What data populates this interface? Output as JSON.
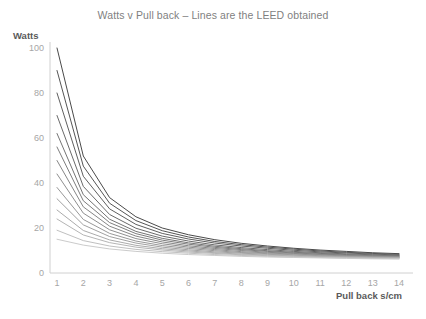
{
  "chart_data": {
    "type": "line",
    "title": "Watts v Pull back – Lines are the LEED obtained",
    "xlabel": "Pull back s/cm",
    "ylabel": "Watts",
    "grid": false,
    "legend": "none",
    "xlim": [
      1,
      14
    ],
    "ylim": [
      0,
      100
    ],
    "x": [
      1,
      2,
      3,
      4,
      5,
      6,
      7,
      8,
      9,
      10,
      11,
      12,
      13,
      14
    ],
    "xticks": [
      "1",
      "2",
      "3",
      "4",
      "5",
      "6",
      "7",
      "8",
      "9",
      "10",
      "11",
      "12",
      "13",
      "14"
    ],
    "yticks": [
      "0",
      "20",
      "40",
      "60",
      "80",
      "100"
    ],
    "ytick_values": [
      0,
      20,
      40,
      60,
      80,
      100
    ],
    "series": [
      {
        "name": "LEED 100",
        "color": "#4a4a4a",
        "values": [
          100,
          52.0,
          33.5,
          25.0,
          20.0,
          17.0,
          14.8,
          13.2,
          12.0,
          11.0,
          10.2,
          9.6,
          9.0,
          8.6
        ]
      },
      {
        "name": "LEED 90",
        "color": "#555555",
        "values": [
          90,
          47.5,
          31.0,
          23.3,
          18.8,
          16.0,
          14.0,
          12.6,
          11.5,
          10.6,
          9.8,
          9.2,
          8.7,
          8.3
        ]
      },
      {
        "name": "LEED 80",
        "color": "#5f5f5f",
        "values": [
          80,
          43.0,
          28.5,
          21.6,
          17.6,
          15.1,
          13.3,
          12.0,
          11.0,
          10.1,
          9.4,
          8.9,
          8.4,
          8.0
        ]
      },
      {
        "name": "LEED 70",
        "color": "#6a6a6a",
        "values": [
          70,
          38.5,
          26.0,
          19.9,
          16.4,
          14.2,
          12.5,
          11.3,
          10.4,
          9.6,
          9.0,
          8.5,
          8.1,
          7.8
        ]
      },
      {
        "name": "LEED 62",
        "color": "#747474",
        "values": [
          62,
          34.8,
          23.9,
          18.5,
          15.4,
          13.4,
          11.9,
          10.8,
          9.9,
          9.2,
          8.7,
          8.2,
          7.9,
          7.6
        ]
      },
      {
        "name": "LEED 56",
        "color": "#7d7d7d",
        "values": [
          56,
          32.1,
          22.4,
          17.5,
          14.6,
          12.8,
          11.4,
          10.4,
          9.6,
          8.9,
          8.4,
          8.0,
          7.7,
          7.4
        ]
      },
      {
        "name": "LEED 50",
        "color": "#868686",
        "values": [
          50,
          29.4,
          20.8,
          16.4,
          13.8,
          12.1,
          10.9,
          10.0,
          9.2,
          8.7,
          8.2,
          7.8,
          7.5,
          7.2
        ]
      },
      {
        "name": "LEED 44",
        "color": "#8f8f8f",
        "values": [
          44,
          26.6,
          19.2,
          15.3,
          13.0,
          11.5,
          10.4,
          9.5,
          8.9,
          8.4,
          8.0,
          7.6,
          7.3,
          7.1
        ]
      },
      {
        "name": "LEED 38",
        "color": "#989898",
        "values": [
          38,
          23.8,
          17.6,
          14.2,
          12.2,
          10.9,
          9.9,
          9.1,
          8.6,
          8.1,
          7.7,
          7.4,
          7.2,
          7.0
        ]
      },
      {
        "name": "LEED 33",
        "color": "#a1a1a1",
        "values": [
          33,
          21.4,
          16.2,
          13.3,
          11.5,
          10.3,
          9.4,
          8.8,
          8.3,
          7.9,
          7.5,
          7.3,
          7.0,
          6.9
        ]
      },
      {
        "name": "LEED 28",
        "color": "#ababab",
        "values": [
          28,
          18.9,
          14.7,
          12.3,
          10.8,
          9.8,
          9.0,
          8.4,
          8.0,
          7.6,
          7.3,
          7.1,
          6.9,
          6.7
        ]
      },
      {
        "name": "LEED 24",
        "color": "#b5b5b5",
        "values": [
          24,
          16.9,
          13.5,
          11.5,
          10.2,
          9.3,
          8.7,
          8.1,
          7.7,
          7.4,
          7.1,
          6.9,
          6.7,
          6.6
        ]
      },
      {
        "name": "LEED 19",
        "color": "#c0c0c0",
        "values": [
          19,
          14.4,
          12.0,
          10.5,
          9.5,
          8.8,
          8.2,
          7.8,
          7.4,
          7.1,
          6.9,
          6.7,
          6.5,
          6.4
        ]
      },
      {
        "name": "LEED 15",
        "color": "#cbcbcb",
        "values": [
          15,
          12.4,
          10.7,
          9.6,
          8.8,
          8.2,
          7.8,
          7.4,
          7.1,
          6.9,
          6.7,
          6.5,
          6.3,
          6.2
        ]
      }
    ],
    "axis_color": "#d0d0d0"
  }
}
